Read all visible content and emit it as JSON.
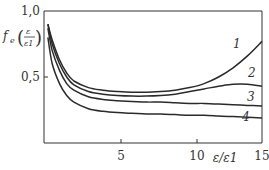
{
  "chart_data": {
    "type": "line",
    "title": "",
    "xlabel": "ε/ε1",
    "ylabel": "fe(ε/ε1)",
    "xlim": [
      0,
      15
    ],
    "ylim": [
      0,
      1.0
    ],
    "x_ticks": [
      5,
      10,
      15
    ],
    "x_tick_labels": [
      "5",
      "10",
      "15"
    ],
    "y_ticks": [
      0.5,
      1.0
    ],
    "y_tick_labels": [
      "0,5",
      "1,0"
    ],
    "grid": false,
    "legend": "inline curve labels",
    "x": [
      0.2,
      0.5,
      1,
      1.5,
      2,
      3,
      4,
      5,
      6,
      7,
      8,
      9,
      10,
      11,
      12,
      13,
      14,
      15
    ],
    "series": [
      {
        "name": "1",
        "values": [
          0.9,
          0.78,
          0.63,
          0.53,
          0.47,
          0.42,
          0.4,
          0.39,
          0.385,
          0.385,
          0.39,
          0.4,
          0.42,
          0.45,
          0.5,
          0.57,
          0.66,
          0.77
        ]
      },
      {
        "name": "2",
        "values": [
          0.9,
          0.75,
          0.6,
          0.5,
          0.44,
          0.39,
          0.37,
          0.36,
          0.355,
          0.355,
          0.36,
          0.37,
          0.39,
          0.41,
          0.43,
          0.445,
          0.445,
          0.43
        ]
      },
      {
        "name": "3",
        "values": [
          0.87,
          0.7,
          0.55,
          0.45,
          0.4,
          0.35,
          0.33,
          0.32,
          0.315,
          0.31,
          0.31,
          0.305,
          0.3,
          0.3,
          0.295,
          0.29,
          0.285,
          0.28
        ]
      },
      {
        "name": "4",
        "values": [
          0.8,
          0.6,
          0.45,
          0.36,
          0.31,
          0.26,
          0.24,
          0.23,
          0.225,
          0.22,
          0.22,
          0.215,
          0.21,
          0.21,
          0.205,
          0.2,
          0.195,
          0.19
        ]
      }
    ]
  },
  "labels": {
    "y_axis": "f",
    "y_axis_sub": "e",
    "y_axis_frac_num": "ε",
    "y_axis_frac_den": "ε1",
    "x_axis": "ε/ε1",
    "curve_1": "1",
    "curve_2": "2",
    "curve_3": "3",
    "curve_4": "4",
    "y_tick_1": "1,0",
    "y_tick_05": "0,5",
    "x_tick_5": "5",
    "x_tick_10": "10",
    "x_tick_15": "15"
  },
  "colors": {
    "line": "#2a2a2a",
    "axis": "#333333"
  }
}
